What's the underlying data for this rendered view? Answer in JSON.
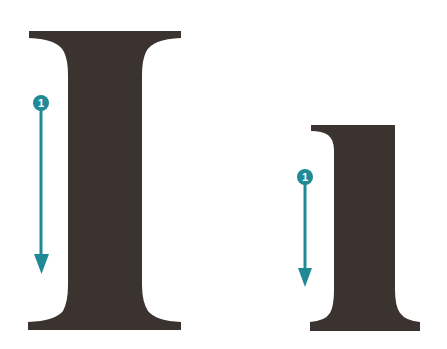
{
  "colors": {
    "background": "#ffffff",
    "glyph": "#3a3330",
    "annotation": "#1f8a96"
  },
  "glyphs": [
    {
      "name": "large-capital-i",
      "char": "I",
      "annotation": {
        "label": "1",
        "direction": "down"
      }
    },
    {
      "name": "small-lowercase-l",
      "char": "l",
      "annotation": {
        "label": "1",
        "direction": "down"
      }
    }
  ]
}
